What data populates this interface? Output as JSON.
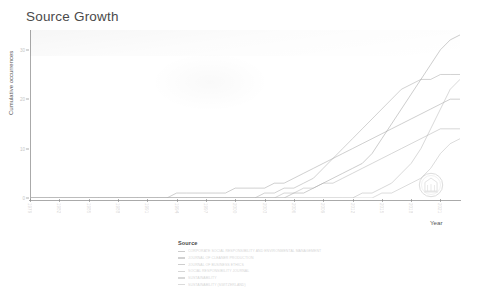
{
  "chart_data": {
    "type": "line",
    "title": "Source Growth",
    "xlabel": "Year",
    "ylabel": "Cumulative occurrences",
    "legend_title": "Source",
    "legend_position": "bottom",
    "grid": false,
    "xlim": [
      1979,
      2023
    ],
    "ylim": [
      0,
      34
    ],
    "y_ticks": [
      0,
      10,
      20,
      30
    ],
    "y_tick_labels": [
      "0",
      "10",
      "20",
      "30"
    ],
    "x_ticks": [
      1979,
      1982,
      1985,
      1988,
      1991,
      1994,
      1997,
      2000,
      2003,
      2006,
      2009,
      2012,
      2015,
      2018,
      2021
    ],
    "x_tick_labels": [
      "1979",
      "1982",
      "1985",
      "1988",
      "1991",
      "1994",
      "1997",
      "2000",
      "2003",
      "2006",
      "2009",
      "2012",
      "2015",
      "2018",
      "2021"
    ],
    "x": [
      1979,
      1980,
      1981,
      1982,
      1983,
      1984,
      1985,
      1986,
      1987,
      1988,
      1989,
      1990,
      1991,
      1992,
      1993,
      1994,
      1995,
      1996,
      1997,
      1998,
      1999,
      2000,
      2001,
      2002,
      2003,
      2004,
      2005,
      2006,
      2007,
      2008,
      2009,
      2010,
      2011,
      2012,
      2013,
      2014,
      2015,
      2016,
      2017,
      2018,
      2019,
      2020,
      2021,
      2022,
      2023
    ],
    "series": [
      {
        "name": "CORPORATE SOCIAL RESPONSIBILITY AND ENVIRONMENTAL MANAGEMENT",
        "color": "#9a9a9a",
        "values": [
          0,
          0,
          0,
          0,
          0,
          0,
          0,
          0,
          0,
          0,
          0,
          0,
          0,
          0,
          0,
          0,
          0,
          0,
          0,
          0,
          0,
          0,
          0,
          0,
          0,
          0,
          0,
          1,
          1,
          2,
          3,
          4,
          5,
          6,
          7,
          9,
          12,
          15,
          18,
          21,
          24,
          27,
          30,
          32,
          33
        ]
      },
      {
        "name": "JOURNAL OF CLEANER PRODUCTION",
        "color": "#a3a3a3",
        "values": [
          0,
          0,
          0,
          0,
          0,
          0,
          0,
          0,
          0,
          0,
          0,
          0,
          0,
          0,
          0,
          0,
          0,
          0,
          0,
          0,
          0,
          0,
          0,
          0,
          1,
          1,
          2,
          2,
          3,
          4,
          6,
          8,
          10,
          12,
          14,
          16,
          18,
          20,
          22,
          23,
          24,
          24,
          25,
          25,
          25
        ]
      },
      {
        "name": "JOURNAL OF BUSINESS ETHICS",
        "color": "#9e9e9e",
        "values": [
          0,
          0,
          0,
          0,
          0,
          0,
          0,
          0,
          0,
          0,
          0,
          0,
          0,
          0,
          0,
          1,
          1,
          1,
          1,
          1,
          1,
          2,
          2,
          2,
          2,
          3,
          3,
          4,
          5,
          6,
          7,
          8,
          9,
          10,
          11,
          12,
          13,
          14,
          15,
          16,
          17,
          18,
          19,
          20,
          20
        ]
      },
      {
        "name": "SOCIAL RESPONSIBILITY JOURNAL",
        "color": "#adadad",
        "values": [
          0,
          0,
          0,
          0,
          0,
          0,
          0,
          0,
          0,
          0,
          0,
          0,
          0,
          0,
          0,
          0,
          0,
          0,
          0,
          0,
          0,
          0,
          0,
          0,
          0,
          0,
          1,
          1,
          2,
          2,
          3,
          3,
          4,
          5,
          6,
          7,
          8,
          9,
          10,
          11,
          12,
          13,
          14,
          14,
          14
        ]
      },
      {
        "name": "SUSTAINABILITY",
        "color": "#b2b2b2",
        "values": [
          0,
          0,
          0,
          0,
          0,
          0,
          0,
          0,
          0,
          0,
          0,
          0,
          0,
          0,
          0,
          0,
          0,
          0,
          0,
          0,
          0,
          0,
          0,
          0,
          0,
          0,
          0,
          0,
          0,
          0,
          0,
          0,
          0,
          0,
          1,
          1,
          2,
          3,
          5,
          7,
          10,
          14,
          18,
          22,
          24
        ]
      },
      {
        "name": "SUSTAINABILITY (SWITZERLAND)",
        "color": "#b8b8b8",
        "values": [
          0,
          0,
          0,
          0,
          0,
          0,
          0,
          0,
          0,
          0,
          0,
          0,
          0,
          0,
          0,
          0,
          0,
          0,
          0,
          0,
          0,
          0,
          0,
          0,
          0,
          0,
          0,
          0,
          0,
          0,
          0,
          0,
          0,
          0,
          0,
          0,
          1,
          1,
          2,
          3,
          4,
          6,
          9,
          11,
          12
        ]
      }
    ]
  },
  "watermark": {
    "name": "institutional-seal-watermark"
  }
}
